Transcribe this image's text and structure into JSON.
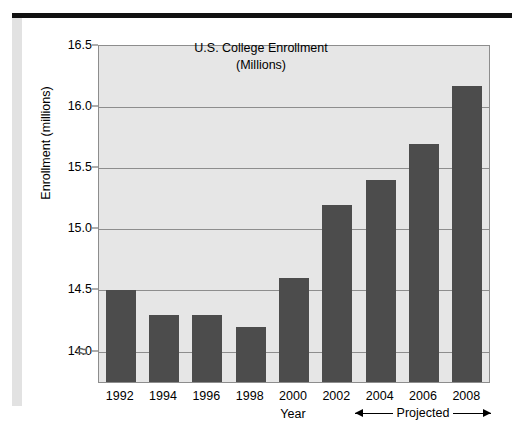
{
  "chart_data": {
    "type": "bar",
    "title": "U.S. College Enrollment",
    "subtitle": "(Millions)",
    "xlabel": "Year",
    "ylabel": "Enrollment (millions)",
    "categories": [
      "1992",
      "1994",
      "1996",
      "1998",
      "2000",
      "2002",
      "2004",
      "2006",
      "2008"
    ],
    "values": [
      14.5,
      14.3,
      14.3,
      14.2,
      14.6,
      15.2,
      15.4,
      15.7,
      16.17
    ],
    "ylim": [
      13.75,
      16.5
    ],
    "yticks": [
      "16.5",
      "16.0",
      "15.5",
      "15.0",
      "14.5",
      "14.0"
    ],
    "ytick_values": [
      16.5,
      16.0,
      15.5,
      15.0,
      14.5,
      14.0
    ],
    "grid": true,
    "axis_break": true,
    "axis_break_symbol": "≈",
    "legend": "none",
    "bar_color": "#4c4c4c",
    "plot_background": "#e6e6e6",
    "grid_color": "#8d8d8d",
    "annotations": [
      {
        "name": "projected-range",
        "label": "Projected",
        "from": "2004",
        "to": "2008",
        "style": "double-arrow"
      }
    ]
  }
}
